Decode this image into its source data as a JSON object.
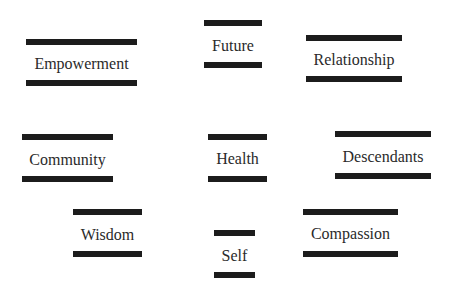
{
  "diagram": {
    "items": [
      {
        "label": "Empowerment",
        "x": 26,
        "w": 111,
        "top": 39,
        "bottom": 80,
        "text_y": 55
      },
      {
        "label": "Future",
        "x": 204,
        "w": 58,
        "top": 20,
        "bottom": 62,
        "text_y": 37
      },
      {
        "label": "Relationship",
        "x": 306,
        "w": 96,
        "top": 35,
        "bottom": 76,
        "text_y": 51
      },
      {
        "label": "Community",
        "x": 22,
        "w": 91,
        "top": 134,
        "bottom": 176,
        "text_y": 151
      },
      {
        "label": "Health",
        "x": 208,
        "w": 59,
        "top": 134,
        "bottom": 176,
        "text_y": 150
      },
      {
        "label": "Descendants",
        "x": 335,
        "w": 96,
        "top": 131,
        "bottom": 173,
        "text_y": 148
      },
      {
        "label": "Wisdom",
        "x": 73,
        "w": 69,
        "top": 209,
        "bottom": 251,
        "text_y": 226
      },
      {
        "label": "Self",
        "x": 214,
        "w": 41,
        "top": 230,
        "bottom": 272,
        "text_y": 247
      },
      {
        "label": "Compassion",
        "x": 303,
        "w": 95,
        "top": 209,
        "bottom": 251,
        "text_y": 225
      }
    ]
  }
}
